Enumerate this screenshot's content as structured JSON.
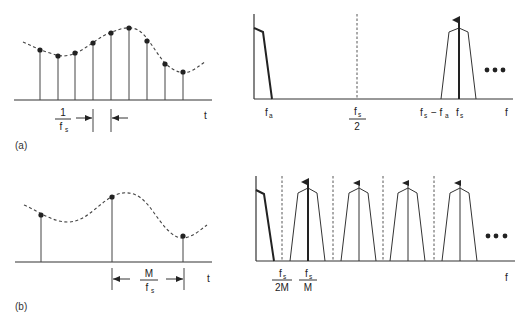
{
  "panels": [
    {
      "id": "a",
      "label": "(a)",
      "time_domain": {
        "axis_label": "t",
        "spacing_label": {
          "num": "1",
          "den": "f",
          "den_sub": "s"
        },
        "samples": [
          [
            40,
            50
          ],
          [
            58,
            56
          ],
          [
            75,
            53
          ],
          [
            93,
            43
          ],
          [
            111,
            33
          ],
          [
            129,
            28
          ],
          [
            147,
            41
          ],
          [
            165,
            64
          ],
          [
            183,
            72
          ]
        ]
      },
      "freq_domain": {
        "axis_label": "f",
        "tick_labels": [
          {
            "text": "f",
            "sub": "a",
            "x": 268
          },
          {
            "text": "f",
            "sub": "s",
            "den": "2",
            "x": 357
          },
          {
            "text": "f",
            "sub": "s",
            "extra": "− f",
            "extra_sub": "a",
            "x": 425
          },
          {
            "text": "f",
            "sub": "s",
            "x": 459
          }
        ],
        "ellipsis": "•••"
      }
    },
    {
      "id": "b",
      "label": "(b)",
      "time_domain": {
        "axis_label": "t",
        "spacing_label": {
          "num": "M",
          "den": "f",
          "den_sub": "s"
        },
        "samples": [
          [
            41,
            215
          ],
          [
            112,
            197
          ],
          [
            183,
            236
          ]
        ]
      },
      "freq_domain": {
        "axis_label": "f",
        "tick_labels": [
          {
            "num": "f",
            "num_sub": "s",
            "den": "2M",
            "x": 282
          },
          {
            "num": "f",
            "num_sub": "s",
            "den": "M",
            "x": 308
          }
        ],
        "image_centers": [
          308,
          359,
          408,
          460
        ],
        "dashed_lines": [
          282,
          333,
          383,
          434
        ],
        "ellipsis": "•••"
      }
    }
  ],
  "colors": {
    "ink": "#333333",
    "background": "#ffffff"
  }
}
